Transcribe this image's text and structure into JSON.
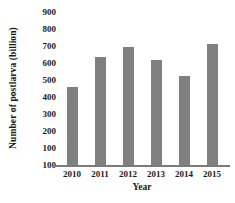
{
  "chart_data": {
    "type": "bar",
    "title": "",
    "xlabel": "Year",
    "ylabel": "Number of postlarva (billion)",
    "categories": [
      "2010",
      "2011",
      "2012",
      "2013",
      "2014",
      "2015"
    ],
    "values": [
      460,
      635,
      695,
      615,
      525,
      710
    ],
    "ytick_labels": [
      "900",
      "800",
      "700",
      "600",
      "500",
      "400",
      "300",
      "200",
      "100",
      "100"
    ],
    "ytick_values": [
      900,
      800,
      700,
      600,
      500,
      400,
      300,
      200,
      100,
      0
    ],
    "ylim": [
      0,
      900
    ],
    "grid": false,
    "legend": null,
    "bar_color": "#808080",
    "axis_color": "#7a7a7a",
    "text_color": "#1a1a1a"
  }
}
